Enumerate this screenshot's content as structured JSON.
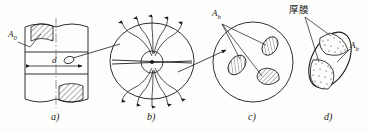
{
  "figure": {
    "type": "technical-diagram",
    "background_color": "#fdfdfb",
    "line_color": "#1a1a1a"
  },
  "panels": [
    {
      "id": "a",
      "caption": "a)",
      "content": "cylindrical specimen with hatched fracture zones and diameter dimension",
      "labels": {
        "area_symbol": "A",
        "area_subscript": "0",
        "diameter_symbol": "d"
      }
    },
    {
      "id": "b",
      "caption": "b)",
      "content": "magnified circle showing stress flow lines deflected around central void",
      "labels": {}
    },
    {
      "id": "c",
      "caption": "c)",
      "content": "magnified circle showing three hatched inclusion particles",
      "labels": {
        "area_symbol": "A",
        "area_subscript": "b"
      }
    },
    {
      "id": "d",
      "caption": "d)",
      "content": "single particle with stippled thick-film coating regions",
      "labels": {
        "film_label": "厚膜",
        "area_symbol": "A",
        "area_subscript": "b"
      }
    }
  ]
}
